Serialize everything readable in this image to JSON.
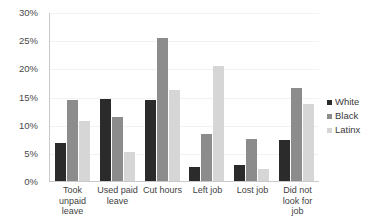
{
  "chart_data": {
    "type": "bar",
    "title": "",
    "subtitle": "",
    "xlabel": "",
    "ylabel": "",
    "ylim": [
      0,
      30
    ],
    "y_tick_labels": [
      "30%",
      "25%",
      "20%",
      "15%",
      "10%",
      "5%",
      "0%"
    ],
    "y_tick_values": [
      30,
      25,
      20,
      15,
      10,
      5,
      0
    ],
    "grid": true,
    "grid_axis": "y",
    "legend_position": "right",
    "value_unit": "percent",
    "categories": [
      "Took unpaid leave",
      "Used paid leave",
      "Cut hours",
      "Left job",
      "Lost job",
      "Did not look for job"
    ],
    "series": [
      {
        "name": "White",
        "color": "#2b2b2b",
        "values": [
          6.8,
          14.6,
          14.3,
          2.5,
          2.9,
          7.2
        ]
      },
      {
        "name": "Black",
        "color": "#8c8c8c",
        "values": [
          14.4,
          11.4,
          25.4,
          8.3,
          7.4,
          16.5
        ]
      },
      {
        "name": "Latinx",
        "color": "#d6d6d6",
        "values": [
          10.6,
          5.2,
          16.1,
          20.5,
          2.2,
          13.6
        ]
      }
    ]
  }
}
